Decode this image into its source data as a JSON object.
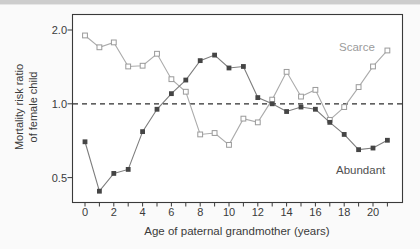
{
  "figure": {
    "y_axis": {
      "title_line1": "Mortality risk ratio",
      "title_line2": "of female child",
      "ticks": [
        {
          "label": "2.0",
          "value": 2.0
        },
        {
          "label": "1.0",
          "value": 1.0
        },
        {
          "label": "0.5",
          "value": 0.5
        }
      ]
    },
    "x_axis": {
      "title": "Age of paternal grandmother (years)",
      "range": [
        0,
        21
      ],
      "minor_tick_step": 1,
      "labeled_ticks": [
        {
          "label": "0",
          "value": 0
        },
        {
          "label": "2",
          "value": 2
        },
        {
          "label": "4",
          "value": 4
        },
        {
          "label": "6",
          "value": 6
        },
        {
          "label": "8",
          "value": 8
        },
        {
          "label": "10",
          "value": 10
        },
        {
          "label": "12",
          "value": 12
        },
        {
          "label": "14",
          "value": 14
        },
        {
          "label": "16",
          "value": 16
        },
        {
          "label": "18",
          "value": 18
        },
        {
          "label": "20",
          "value": 20
        }
      ]
    },
    "series_labels": {
      "scarce": "Scarce",
      "abundant": "Abundant"
    },
    "colors": {
      "frame": "#3a3a3a",
      "reference_line": "#2e2e2e",
      "scarce_line": "#ababab",
      "scarce_marker_stroke": "#9a9a9a",
      "scarce_marker_fill": "#ffffff",
      "abundant_line": "#7d7d7d",
      "abundant_marker_fill": "#454545",
      "tick": "#3a3a3a"
    }
  },
  "chart_data": {
    "type": "line",
    "title": "",
    "xlabel": "Age of paternal grandmother (years)",
    "ylabel": "Mortality risk ratio of female child",
    "y_scale": "log2",
    "ylim": [
      0.4,
      2.3
    ],
    "yticks": [
      0.5,
      1.0,
      2.0
    ],
    "xlim": [
      0,
      21
    ],
    "reference_line_y": 1.0,
    "grid": false,
    "legend_position": "inline-annotations",
    "x": [
      0,
      1,
      2,
      3,
      4,
      5,
      6,
      7,
      8,
      9,
      10,
      11,
      12,
      13,
      14,
      15,
      16,
      17,
      18,
      19,
      20,
      21
    ],
    "series": [
      {
        "name": "Scarce",
        "marker": "open-square",
        "values": [
          1.9,
          1.7,
          1.78,
          1.42,
          1.43,
          1.6,
          1.26,
          1.12,
          0.75,
          0.76,
          0.68,
          0.87,
          0.84,
          1.04,
          1.35,
          1.07,
          1.14,
          0.86,
          0.97,
          1.17,
          1.42,
          1.65
        ]
      },
      {
        "name": "Abundant",
        "marker": "filled-square",
        "values": [
          0.7,
          0.44,
          0.52,
          0.54,
          0.77,
          0.95,
          1.1,
          1.25,
          1.5,
          1.58,
          1.4,
          1.42,
          1.06,
          1.0,
          0.93,
          0.97,
          0.95,
          0.84,
          0.75,
          0.65,
          0.66,
          0.71
        ]
      }
    ]
  }
}
